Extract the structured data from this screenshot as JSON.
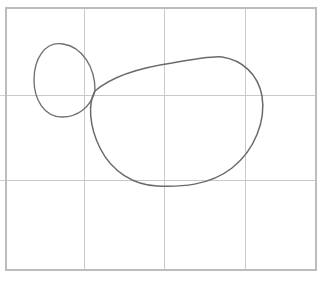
{
  "figure": {
    "background_color": "#ffffff",
    "curve_color": "#6a6a6a",
    "grid_color": "#c9c9c9",
    "border_color": "#bdbdbd",
    "canvas": {
      "width": 325,
      "height": 283
    }
  },
  "grid": {
    "name": "graph-paper-grid",
    "border": {
      "x": 6,
      "y": 8,
      "width": 310,
      "height": 262
    },
    "vertical_lines": [
      84,
      164,
      245
    ],
    "horizontal_lines": [
      95,
      180
    ],
    "left_ticks": [
      95,
      180
    ],
    "cell_count_x": 4,
    "cell_count_y": 3
  },
  "shapes": [
    {
      "id": "small-oval",
      "name": "small-oval-curve",
      "label": "Small oval",
      "bounds": {
        "x_min": 35,
        "x_max": 96,
        "y_min": 43,
        "y_max": 118
      },
      "center": {
        "x": 65,
        "y": 80
      },
      "radius_x": 30,
      "radius_y": 37,
      "path": "M 95 90 C 95 68, 83 47, 63 44 C 44 41, 34 60, 34 80 C 34 99, 44 117, 62 117 C 79 117, 90 106, 94 94 Z"
    },
    {
      "id": "large-blob",
      "name": "large-blob-curve",
      "label": "Large blob",
      "bounds": {
        "x_min": 91,
        "x_max": 263,
        "y_min": 56,
        "y_max": 187
      },
      "center": {
        "x": 177,
        "y": 121
      },
      "path": "M 95 91 C 110 78, 138 68, 172 63 C 200 58, 214 56, 222 57 C 242 60, 258 74, 262 96 C 266 120, 255 150, 232 168 C 209 186, 180 187, 157 186 C 134 185, 112 172, 100 148 C 89 126, 88 103, 95 91 Z"
    }
  ],
  "annotations": {
    "cusp_point": {
      "x": 95,
      "y": 91,
      "label": "tangency point"
    }
  }
}
